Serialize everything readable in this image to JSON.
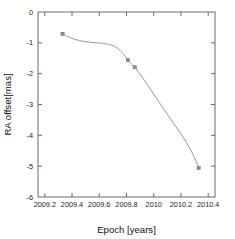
{
  "chart_data": {
    "type": "line",
    "title": "",
    "xlabel": "Epoch [years]",
    "ylabel": "RA offset[mas]",
    "xlim": [
      2009.15,
      2010.45
    ],
    "ylim": [
      -6,
      0
    ],
    "grid": false,
    "legend": false,
    "xticks": [
      2009.2,
      2009.4,
      2009.6,
      2009.8,
      2010.0,
      2010.2,
      2010.4
    ],
    "xticklabels": [
      "2009.2",
      "2009.4",
      "2009.6",
      "2009.8",
      "2010",
      "2010.2",
      "2010.4"
    ],
    "yticks": [
      0,
      -1,
      -2,
      -3,
      -4,
      -5,
      -6
    ],
    "yticklabels": [
      "0",
      "-1",
      "-2",
      "-3",
      "-4",
      "-5",
      "-6"
    ],
    "series": [
      {
        "name": "RA offset",
        "marker": "square",
        "color": "#8d8d8d",
        "x": [
          2009.33,
          2009.81,
          2009.86,
          2010.33
        ],
        "y": [
          -0.71,
          -1.56,
          -1.79,
          -5.06
        ]
      }
    ],
    "curve_points": {
      "x": [
        2009.33,
        2009.38,
        2009.43,
        2009.48,
        2009.53,
        2009.58,
        2009.63,
        2009.68,
        2009.73,
        2009.78,
        2009.81,
        2009.86,
        2009.91,
        2009.96,
        2010.01,
        2010.06,
        2010.11,
        2010.16,
        2010.21,
        2010.26,
        2010.31,
        2010.33
      ],
      "y": [
        -0.71,
        -0.82,
        -0.9,
        -0.95,
        -0.98,
        -1.0,
        -1.02,
        -1.06,
        -1.16,
        -1.38,
        -1.56,
        -1.79,
        -2.08,
        -2.4,
        -2.73,
        -3.06,
        -3.38,
        -3.7,
        -4.02,
        -4.38,
        -4.82,
        -5.06
      ]
    }
  },
  "axis": {
    "x_title": "Epoch [years]",
    "y_title": "RA offset[mas]"
  },
  "caption": {
    "ghost_text": ""
  }
}
